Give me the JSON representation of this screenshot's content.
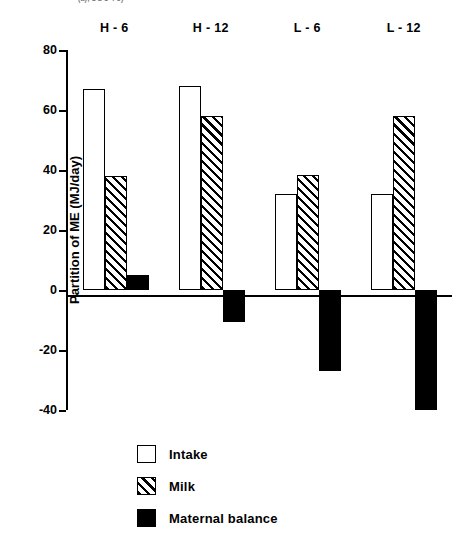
{
  "figure": {
    "clipped_header_text": "(a); 1 2 3 4 5)",
    "ylabel": "Partition of ME (MJ/day)"
  },
  "chart_data": {
    "type": "bar",
    "title": "",
    "xlabel": "",
    "ylabel": "Partition of ME (MJ/day)",
    "ylim": [
      -40,
      80
    ],
    "yticks": [
      80,
      60,
      40,
      20,
      0,
      -20,
      -40
    ],
    "ytick_labels": [
      "80",
      "60",
      "40",
      "20",
      "0",
      "-20",
      "-40"
    ],
    "grid": false,
    "legend_position": "bottom-left",
    "categories": [
      "H - 6",
      "H - 12",
      "L - 6",
      "L - 12"
    ],
    "series": [
      {
        "name": "Intake",
        "fill": "open",
        "values": [
          67,
          68,
          32,
          32
        ]
      },
      {
        "name": "Milk",
        "fill": "hatched",
        "values": [
          38,
          58,
          38.5,
          58
        ]
      },
      {
        "name": "Maternal balance",
        "fill": "solid",
        "values": [
          5,
          -10.5,
          -27,
          -40
        ]
      }
    ]
  },
  "legend": {
    "items": [
      {
        "label": "Intake",
        "swatch": "open-square-swatch"
      },
      {
        "label": "Milk",
        "swatch": "hatched-square-swatch"
      },
      {
        "label": "Maternal balance",
        "swatch": "solid-square-swatch"
      }
    ]
  }
}
